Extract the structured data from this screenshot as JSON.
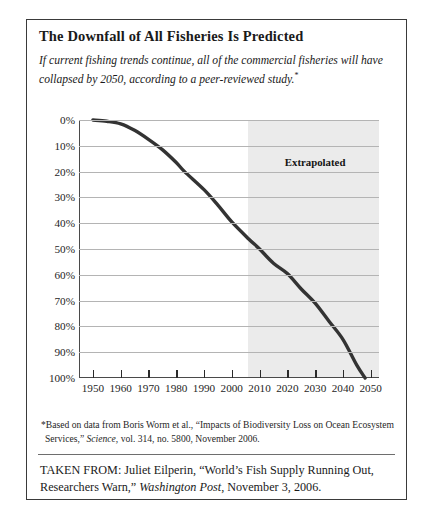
{
  "figure": {
    "title": "The Downfall of All Fisheries Is Predicted",
    "subtitle_text": "If current fishing trends continue, all of the commercial fisheries will have collapsed by 2050, according to a peer-reviewed study.",
    "subtitle_footnote_marker": "*",
    "footnote_marker": "*",
    "footnote_part1": "Based on data from Boris Worm et al., “Impacts of Biodiversity Loss on Ocean Ecosystem Services,” ",
    "footnote_italic": "Science",
    "footnote_part2": ", vol. 314, no. 5800, November 2006.",
    "source_prefix": "TAKEN FROM: Juliet Eilperin, “World’s Fish Supply Running Out, Researchers Warn,” ",
    "source_italic": "Washington Post",
    "source_suffix": ", November 3, 2006."
  },
  "colors": {
    "curve": "#333333",
    "gridline": "#b4b4b4",
    "axis": "#4a4a4a",
    "extrapolated_band": "#ebebeb",
    "border": "#3a3a3a",
    "text": "#1a1a1a"
  },
  "chart_data": {
    "type": "line",
    "title": "The Downfall of All Fisheries Is Predicted",
    "xlabel": "",
    "ylabel": "",
    "xlim": [
      1945,
      2053
    ],
    "ylim": [
      0,
      100
    ],
    "y_inverted": true,
    "grid": true,
    "legend": "none",
    "ytick_labels": [
      "0%",
      "10%",
      "20%",
      "30%",
      "40%",
      "50%",
      "60%",
      "70%",
      "80%",
      "90%",
      "100%"
    ],
    "ytick_values": [
      0,
      10,
      20,
      30,
      40,
      50,
      60,
      70,
      80,
      90,
      100
    ],
    "xtick_labels": [
      "1950",
      "1960",
      "1970",
      "1980",
      "1990",
      "2000",
      "2010",
      "2020",
      "2030",
      "2040",
      "2050"
    ],
    "xtick_values": [
      1950,
      1960,
      1970,
      1980,
      1990,
      2000,
      2010,
      2020,
      2030,
      2040,
      2050
    ],
    "series": [
      {
        "name": "Percent of commercial fisheries collapsed",
        "x": [
          1950,
          1955,
          1960,
          1965,
          1970,
          1975,
          1980,
          1983,
          1990,
          1995,
          2000,
          2006,
          2010,
          2015,
          2020,
          2025,
          2030,
          2035,
          2040,
          2045,
          2048
        ],
        "values": [
          0,
          0.5,
          1.5,
          4,
          7.5,
          11.5,
          16.5,
          20,
          27,
          33,
          39.5,
          46,
          50,
          55.5,
          59.5,
          65.5,
          71,
          78,
          85,
          95,
          100
        ]
      }
    ],
    "annotations": [
      {
        "label": "Extrapolated",
        "type": "shaded-region-label",
        "region_start": 2006,
        "region_end": 2053,
        "label_x": 2030,
        "label_y": 14
      }
    ]
  }
}
